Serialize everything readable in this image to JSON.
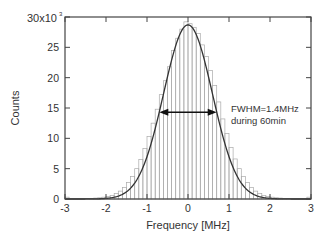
{
  "chart_data": {
    "type": "bar",
    "title": "",
    "xlabel": "Frequency [MHz]",
    "ylabel": "Counts",
    "xlim": [
      -3,
      3
    ],
    "ylim": [
      0,
      30000
    ],
    "y_multiplier_label": "30x10",
    "y_multiplier_exp": "3",
    "xticks": [
      "-3",
      "-2",
      "-1",
      "0",
      "1",
      "2",
      "3"
    ],
    "yticks": [
      "0",
      "5",
      "10",
      "15",
      "20",
      "25"
    ],
    "bin_width": 0.1,
    "bin_centers": [
      -2.95,
      -2.85,
      -2.75,
      -2.65,
      -2.55,
      -2.45,
      -2.35,
      -2.25,
      -2.15,
      -2.05,
      -1.95,
      -1.85,
      -1.75,
      -1.65,
      -1.55,
      -1.45,
      -1.35,
      -1.25,
      -1.15,
      -1.05,
      -0.95,
      -0.85,
      -0.75,
      -0.65,
      -0.55,
      -0.45,
      -0.35,
      -0.25,
      -0.15,
      -0.05,
      0.05,
      0.15,
      0.25,
      0.35,
      0.45,
      0.55,
      0.65,
      0.75,
      0.85,
      0.95,
      1.05,
      1.15,
      1.25,
      1.35,
      1.45,
      1.55,
      1.65,
      1.75,
      1.85,
      1.95,
      2.05,
      2.15,
      2.25,
      2.35,
      2.45,
      2.55,
      2.65,
      2.75,
      2.85,
      2.95
    ],
    "counts": [
      300,
      100,
      100,
      100,
      100,
      100,
      100,
      150,
      200,
      300,
      400,
      600,
      900,
      1300,
      1900,
      2700,
      3700,
      5000,
      6500,
      8300,
      10300,
      12500,
      14800,
      17200,
      19500,
      21800,
      24500,
      26500,
      28000,
      29200,
      28900,
      28300,
      27300,
      25400,
      23500,
      21200,
      18700,
      16000,
      13200,
      10800,
      8500,
      6600,
      5000,
      3700,
      2700,
      1900,
      1300,
      900,
      600,
      400,
      300,
      200,
      150,
      100,
      100,
      100,
      100,
      100,
      100,
      300
    ],
    "fit": {
      "type": "gaussian",
      "amplitude": 28700,
      "center": 0.0,
      "fwhm": 1.4
    },
    "annotation": {
      "line1": "FWHM=1.4MHz",
      "line2": "during 60min",
      "arrow_x": [
        -0.7,
        0.7
      ],
      "arrow_y": 14300
    },
    "grid": false,
    "legend": "none"
  }
}
